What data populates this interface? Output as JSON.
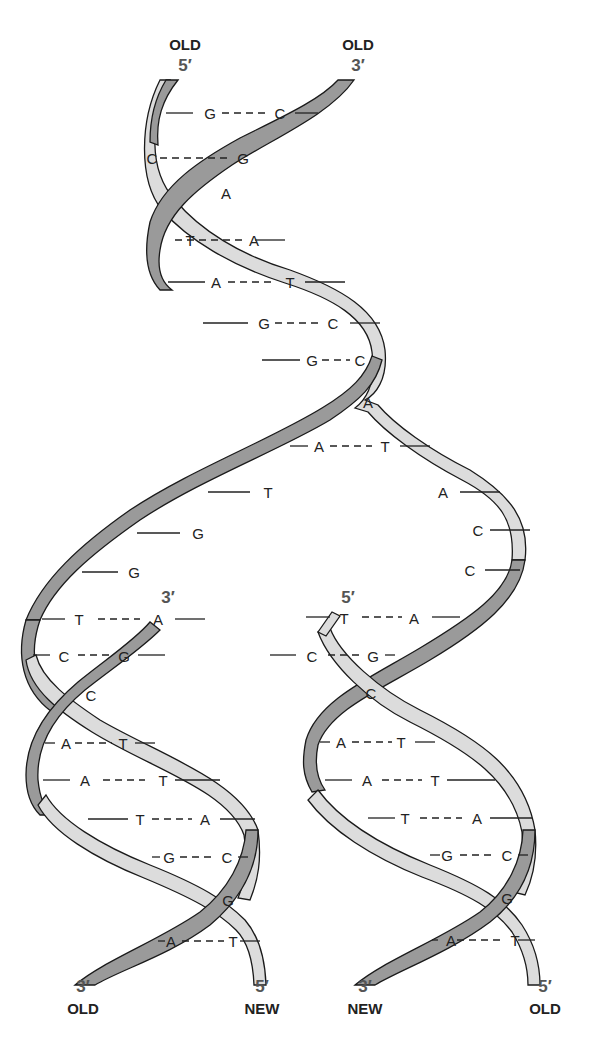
{
  "colors": {
    "dark_strand": "#9a9a9a",
    "light_strand": "#dcdcdc",
    "outline": "#1a1a1a",
    "text": "#222222",
    "prime_text": "#555555"
  },
  "labels": {
    "top_left_word": "OLD",
    "top_left_prime": "5′",
    "top_right_word": "OLD",
    "top_right_prime": "3′",
    "mid_left_prime": "3′",
    "mid_right_prime": "5′",
    "bottom_1_prime": "3′",
    "bottom_1_word": "OLD",
    "bottom_2_prime": "5′",
    "bottom_2_word": "NEW",
    "bottom_3_prime": "3′",
    "bottom_3_word": "NEW",
    "bottom_4_prime": "5′",
    "bottom_4_word": "OLD"
  },
  "parent_helix": {
    "pairs": [
      {
        "left": "G",
        "right": "C"
      },
      {
        "left": "C",
        "right": "G"
      },
      {
        "left": "A",
        "right": ""
      },
      {
        "left": "T",
        "right": "A"
      },
      {
        "left": "A",
        "right": "T"
      },
      {
        "left": "G",
        "right": "C"
      },
      {
        "left": "G",
        "right": "C"
      },
      {
        "left": "A",
        "right": ""
      },
      {
        "left": "A",
        "right": "T"
      }
    ]
  },
  "unpaired": {
    "left_strand": [
      "T",
      "G",
      "G"
    ],
    "right_strand": [
      "A",
      "C",
      "C"
    ]
  },
  "daughter_left": {
    "pairs": [
      {
        "left": "T",
        "right": "A"
      },
      {
        "left": "C",
        "right": "G"
      },
      {
        "left": "C",
        "right": ""
      },
      {
        "left": "A",
        "right": "T"
      },
      {
        "left": "A",
        "right": "T"
      },
      {
        "left": "T",
        "right": "A"
      },
      {
        "left": "G",
        "right": "C"
      },
      {
        "left": "G",
        "right": ""
      },
      {
        "left": "A",
        "right": "T"
      }
    ]
  },
  "daughter_right": {
    "pairs": [
      {
        "left": "T",
        "right": "A"
      },
      {
        "left": "C",
        "right": "G"
      },
      {
        "left": "C",
        "right": ""
      },
      {
        "left": "A",
        "right": "T"
      },
      {
        "left": "A",
        "right": "T"
      },
      {
        "left": "T",
        "right": "A"
      },
      {
        "left": "G",
        "right": "C"
      },
      {
        "left": "G",
        "right": ""
      },
      {
        "left": "A",
        "right": "T"
      }
    ]
  }
}
